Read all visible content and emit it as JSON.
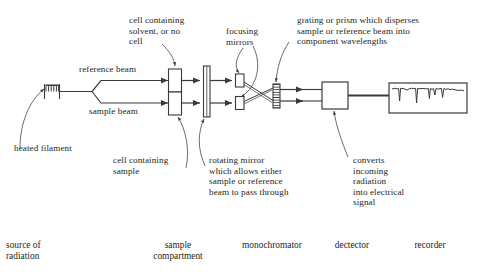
{
  "diagram": {
    "labels": {
      "cell_solvent": "cell containing\nsolvent, or no\ncell",
      "focusing_mirrors": "focusing\nmirrors",
      "grating": "grating or prism which disperses\nsample or reference beam into\ncomponent wavelengths",
      "reference_beam": "reference beam",
      "sample_beam": "sample beam",
      "heated_filament": "heated filament",
      "cell_sample": "cell containing\nsample",
      "rotating_mirror": "rotating mirror\nwhich allows either\nsample or reference\nbeam to pass through",
      "detector_desc": "converts\nincoming\nradiation\ninto electrical\nsignal"
    },
    "categories": [
      {
        "name": "source-of-radiation",
        "text": "source of\nradiation"
      },
      {
        "name": "sample-compartment",
        "text": "sample\ncompartment"
      },
      {
        "name": "monochromator",
        "text": "monochromator"
      },
      {
        "name": "detector",
        "text": "dectector"
      },
      {
        "name": "recorder",
        "text": "recorder"
      }
    ],
    "colors": {
      "ink": "#231f20",
      "line": "#3a3a3a",
      "background": "#ffffff"
    }
  }
}
